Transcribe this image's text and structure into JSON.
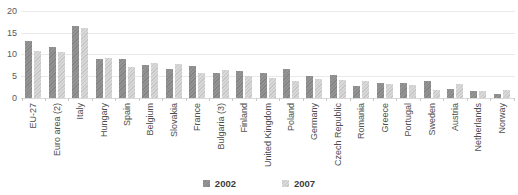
{
  "chart_data": {
    "type": "bar",
    "title": "",
    "xlabel": "",
    "ylabel": "",
    "ylim": [
      0,
      20
    ],
    "yticks": [
      0,
      5,
      10,
      15,
      20
    ],
    "grid": true,
    "legend_position": "bottom",
    "categories": [
      "EU-27",
      "Euro area (2)",
      "Italy",
      "Hungary",
      "Spain",
      "Belgium",
      "Slovakia",
      "France",
      "Bulgaria (3)",
      "Finland",
      "United Kingdom",
      "Poland",
      "Germany",
      "Czech Republic",
      "Romania",
      "Greece",
      "Portugal",
      "Sweden",
      "Austria",
      "Netherlands",
      "Norway"
    ],
    "series": [
      {
        "name": "2002",
        "color": "#8f8f8f",
        "values": [
          13.1,
          11.8,
          16.5,
          9.0,
          9.0,
          7.5,
          6.6,
          7.4,
          5.8,
          6.1,
          5.8,
          6.7,
          5.0,
          5.3,
          2.7,
          3.5,
          3.5,
          4.0,
          2.1,
          1.6,
          1.0
        ]
      },
      {
        "name": "2007",
        "color": "#d7d7d7",
        "values": [
          10.8,
          10.5,
          16.0,
          9.2,
          7.0,
          8.1,
          7.7,
          5.8,
          6.5,
          5.0,
          4.6,
          3.8,
          4.4,
          4.2,
          4.0,
          3.2,
          3.0,
          1.8,
          3.3,
          1.5,
          1.8
        ]
      }
    ]
  },
  "colors": {
    "background": "#ffffff",
    "gridline": "#eaeaea",
    "axis_text": "#595959",
    "category_text": "#4d4d4d",
    "legend_text": "#3b3b3b"
  }
}
